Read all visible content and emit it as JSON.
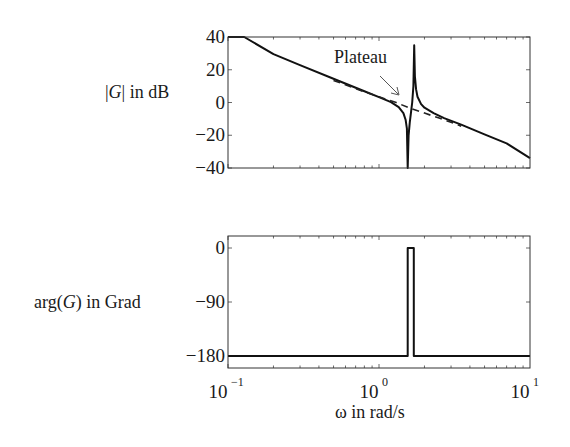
{
  "chart_data": [
    {
      "type": "line",
      "panel": "magnitude",
      "ylabel_parts": {
        "pre": "|",
        "var": "G",
        "post": "| in dB"
      },
      "xscale": "log",
      "xlim": [
        0.1,
        10
      ],
      "ylim": [
        -40,
        40
      ],
      "yticks": [
        40,
        20,
        0,
        -20,
        -40
      ],
      "ytick_labels": [
        "40",
        "20",
        "0",
        "−20",
        "−40"
      ],
      "annotation": {
        "text": "Plateau",
        "points_to": {
          "x": 1.5,
          "y": -3
        }
      },
      "series": [
        {
          "name": "magnitude",
          "style": "solid",
          "x": [
            0.1,
            0.128,
            0.2,
            0.3,
            0.5,
            0.8,
            1.0,
            1.2,
            1.35,
            1.45,
            1.5,
            1.53,
            1.55,
            1.57,
            1.6,
            1.63,
            1.66,
            1.69,
            1.71,
            1.73,
            1.76,
            1.8,
            1.9,
            2.0,
            2.3,
            2.7,
            3.5,
            5,
            7,
            10
          ],
          "y": [
            40,
            40,
            29.5,
            22.8,
            14.5,
            6.9,
            3.3,
            0.2,
            -2.8,
            -6.5,
            -10.5,
            -16,
            -40,
            -20,
            -12,
            -6,
            0,
            10,
            35,
            16,
            8,
            3.5,
            -1,
            -3.2,
            -6.5,
            -9.5,
            -13.5,
            -19.5,
            -25,
            -34
          ]
        },
        {
          "name": "asymptote",
          "style": "dashed",
          "x": [
            0.5,
            0.8,
            1.0,
            1.3,
            1.6,
            2.0,
            2.5,
            3.0,
            3.5
          ],
          "y": [
            13.5,
            6.5,
            3.5,
            0,
            -3.5,
            -6.5,
            -9.5,
            -12,
            -14.5
          ]
        }
      ]
    },
    {
      "type": "line",
      "panel": "phase",
      "ylabel_parts": {
        "pre": "arg(",
        "var": "G",
        "post": ")  in Grad"
      },
      "xlabel": "ω  in rad/s",
      "xscale": "log",
      "xlim": [
        0.1,
        10
      ],
      "ylim": [
        -200,
        20
      ],
      "yticks": [
        0,
        -90,
        -180
      ],
      "ytick_labels": [
        "0",
        "−90",
        "−180"
      ],
      "xticks": [
        0.1,
        1,
        10
      ],
      "xtick_labels": [
        {
          "base": "10",
          "exp": "−1"
        },
        {
          "base": "10",
          "exp": "0"
        },
        {
          "base": "10",
          "exp": "1"
        }
      ],
      "series": [
        {
          "name": "phase",
          "style": "solid",
          "x": [
            0.1,
            1.55,
            1.55,
            1.7,
            1.7,
            10
          ],
          "y": [
            -180,
            -180,
            0,
            0,
            -180,
            -180
          ]
        }
      ]
    }
  ]
}
